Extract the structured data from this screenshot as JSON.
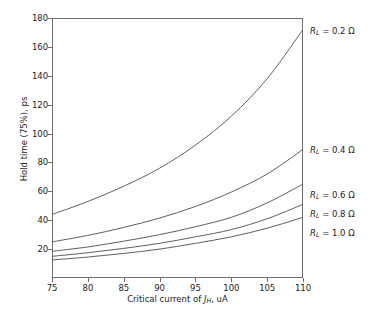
{
  "chart_data": {
    "type": "line",
    "title": "",
    "xlabel": "Critical current of J_H, uA",
    "xlabel_parts": {
      "pre": "Critical current of ",
      "sym": "J",
      "sub": "H",
      "post": ", uA"
    },
    "ylabel": "Hold time (75%), ps",
    "xlim": [
      75,
      110
    ],
    "ylim": [
      0,
      180
    ],
    "xticks": [
      75,
      80,
      85,
      90,
      95,
      100,
      105,
      110
    ],
    "yticks": [
      20,
      40,
      60,
      80,
      100,
      120,
      140,
      160,
      180
    ],
    "grid": false,
    "legend_position": "right-of-axes-annotations",
    "line_color": "#4d4d4d",
    "x": [
      75,
      80,
      85,
      90,
      95,
      100,
      105,
      110
    ],
    "series": [
      {
        "name": "R_L = 0.2 Ω",
        "label_pre": "R",
        "label_sub": "L",
        "label_post": " = 0.2 Ω",
        "values": [
          44,
          53,
          63.5,
          76,
          92,
          112,
          138,
          172
        ]
      },
      {
        "name": "R_L = 0.4 Ω",
        "label_pre": "R",
        "label_sub": "L",
        "label_post": " = 0.4 Ω",
        "values": [
          25,
          29.5,
          35,
          41.5,
          49.5,
          59.5,
          72,
          89
        ]
      },
      {
        "name": "R_L = 0.6 Ω",
        "label_pre": "R",
        "label_sub": "L",
        "label_post": " = 0.6 Ω",
        "values": [
          18.5,
          21.5,
          25.5,
          30,
          35.5,
          42,
          52,
          65
        ]
      },
      {
        "name": "R_L = 0.8 Ω",
        "label_pre": "R",
        "label_sub": "L",
        "label_post": " = 0.8 Ω",
        "values": [
          15,
          17.5,
          20.5,
          24,
          28.5,
          33.5,
          41,
          51
        ]
      },
      {
        "name": "R_L = 1.0 Ω",
        "label_pre": "R",
        "label_sub": "L",
        "label_post": " = 1.0 Ω",
        "values": [
          12.5,
          14.5,
          17,
          20,
          24,
          28.5,
          34.5,
          42
        ]
      }
    ],
    "annotations": [
      {
        "text": "R_L = 0.2 Ω",
        "y_px": 31
      },
      {
        "text": "R_L = 0.4 Ω",
        "y_px": 150
      },
      {
        "text": "R_L = 0.6 Ω",
        "y_px": 195
      },
      {
        "text": "R_L = 0.8 Ω",
        "y_px": 214
      },
      {
        "text": "R_L = 1.0 Ω",
        "y_px": 233
      }
    ]
  }
}
